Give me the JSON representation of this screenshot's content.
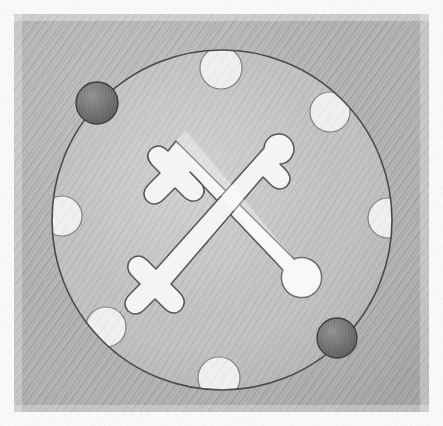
{
  "artwork": {
    "title": "Crossed Tools Emblem on Hatched Disc",
    "medium": "graphite pencil sketch",
    "style": "hand-drawn diagonal hatching",
    "canvas": {
      "width": 443,
      "height": 426,
      "background_color": "#ffffff"
    },
    "paper": {
      "name": "hatched paper panel",
      "x": 14,
      "y": 14,
      "width": 415,
      "height": 398,
      "base_color": "#b6b6b6",
      "hatch_color": "#8e8e8e",
      "hatch_direction": "diagonal-down-right",
      "hatch_angle_deg": 35
    },
    "disc": {
      "name": "large circle",
      "center_x": 222,
      "center_y": 220,
      "radius": 170,
      "fill_color": "#bcbcbc",
      "outline_color": "#4a4a4a",
      "outline_width": 1.6,
      "hatch_direction": "diagonal-down-right"
    },
    "light_dots": {
      "count": 6,
      "fill_color": "#eeeeee",
      "outline_color": "#6a6a6a",
      "items": [
        {
          "label": "top",
          "cx": 221,
          "cy": 68,
          "r": 21,
          "angle_deg": 270
        },
        {
          "label": "upper-right",
          "cx": 330,
          "cy": 112,
          "r": 20,
          "angle_deg": 325
        },
        {
          "label": "right",
          "cx": 388,
          "cy": 218,
          "r": 20,
          "angle_deg": 0
        },
        {
          "label": "left",
          "cx": 62,
          "cy": 216,
          "r": 20,
          "angle_deg": 180
        },
        {
          "label": "lower-left",
          "cx": 106,
          "cy": 327,
          "r": 20,
          "angle_deg": 125
        },
        {
          "label": "bottom",
          "cx": 219,
          "cy": 378,
          "r": 21,
          "angle_deg": 90
        }
      ]
    },
    "dark_dots": {
      "count": 2,
      "fill_color": "#6b6b6b",
      "outline_color": "#3a3a3a",
      "items": [
        {
          "label": "upper-left-dark",
          "cx": 97,
          "cy": 103,
          "r": 21
        },
        {
          "label": "lower-right-dark",
          "cx": 337,
          "cy": 338,
          "r": 20
        }
      ]
    },
    "emblem": {
      "name": "crossed tools glyph",
      "description": "two crossed wrench-like figures forming an X",
      "fill_color": "#f4f4f4",
      "outline_color": "#555555",
      "outline_width": 1.5,
      "center_x": 222,
      "center_y": 215,
      "width": 150,
      "height": 135,
      "arm_terminals": [
        {
          "position": "upper-left",
          "shape": "three-prong-cross"
        },
        {
          "position": "upper-right",
          "shape": "rounded-bulb-with-crossbar"
        },
        {
          "position": "lower-left",
          "shape": "three-prong-cross"
        },
        {
          "position": "lower-right",
          "shape": "round-bulb"
        }
      ]
    }
  },
  "alt_text": "A pencil drawing of a large shaded circle on hatched paper, ringed with six light dots and two dark dots, with a white crossed-tools emblem at the center."
}
